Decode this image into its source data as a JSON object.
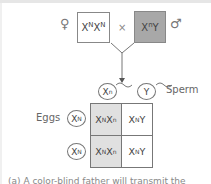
{
  "parents": {
    "female_symbol": "♀",
    "male_symbol": "♂",
    "cross_symbol": "×",
    "female": {
      "base1": "X",
      "sup1": "N",
      "base2": "X",
      "sup2": "N"
    },
    "male": {
      "base1": "X",
      "sup1": "n",
      "base2": "Y"
    }
  },
  "gametes": {
    "sperm_label": "Sperm",
    "eggs_label": "Eggs",
    "sperm": [
      {
        "base": "X",
        "sup": "n"
      },
      {
        "base": "Y",
        "sup": ""
      }
    ],
    "eggs": [
      {
        "base": "X",
        "sup": "N"
      },
      {
        "base": "X",
        "sup": "N"
      }
    ]
  },
  "punnett": {
    "rows": [
      [
        {
          "b1": "X",
          "s1": "N",
          "b2": "X",
          "s2": "n",
          "shaded": true
        },
        {
          "b1": "X",
          "s1": "N",
          "b2": "Y",
          "s2": "",
          "shaded": false
        }
      ],
      [
        {
          "b1": "X",
          "s1": "N",
          "b2": "X",
          "s2": "n",
          "shaded": true
        },
        {
          "b1": "X",
          "s1": "N",
          "b2": "Y",
          "s2": "",
          "shaded": false
        }
      ]
    ],
    "shade_color": "#e0e0e0"
  },
  "colors": {
    "male_box": "#a8a8a8",
    "female_box": "#ffffff"
  },
  "caption": "(a) A color-blind father will transmit the"
}
